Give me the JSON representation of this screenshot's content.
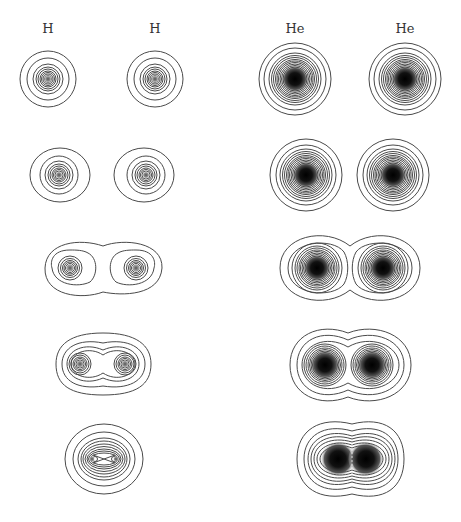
{
  "labels": {
    "h_left": "H",
    "h_right": "H",
    "he_left": "He",
    "he_right": "He"
  },
  "colors": {
    "contour": "#4a4a4a",
    "core_dark": "#111111",
    "background": "#ffffff"
  },
  "rows": [
    {
      "stage": 1,
      "h": {
        "centers": [
          48,
          155
        ],
        "cy": 79
      },
      "he": {
        "centers": [
          295,
          405
        ],
        "cy": 79
      }
    },
    {
      "stage": 2,
      "h": {
        "centers": [
          60,
          146
        ],
        "cy": 175
      },
      "he": {
        "centers": [
          306,
          393
        ],
        "cy": 175
      }
    },
    {
      "stage": 3,
      "h": {
        "centers": [
          70,
          136
        ],
        "cy": 268
      },
      "he": {
        "centers": [
          317,
          383
        ],
        "cy": 268
      }
    },
    {
      "stage": 4,
      "h": {
        "centers": [
          80,
          125
        ],
        "cy": 365
      },
      "he": {
        "centers": [
          325,
          372
        ],
        "cy": 365
      }
    },
    {
      "stage": 5,
      "h": {
        "centers": [
          95,
          114
        ],
        "cy": 459
      },
      "he": {
        "centers": [
          338,
          365
        ],
        "cy": 459
      }
    }
  ]
}
